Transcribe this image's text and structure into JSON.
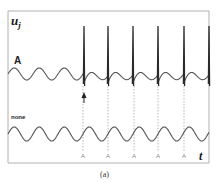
{
  "figure": {
    "y_axis_label": "u",
    "y_axis_subscript": "j",
    "x_axis_label": "t",
    "caption": "(a)",
    "traces": [
      {
        "name": "A",
        "label": "A",
        "type": "sinusoid-with-spikes",
        "center_y": 74,
        "amplitude": 6,
        "period": 25
      },
      {
        "name": "none",
        "label": "none",
        "type": "sinusoid",
        "center_y": 134,
        "amplitude": 7,
        "period": 25
      }
    ],
    "spike_times_px": [
      84,
      108,
      133,
      158,
      184,
      209
    ],
    "stimulus_marks": {
      "label": "A",
      "positions_px": [
        83,
        108,
        134,
        158,
        184
      ]
    },
    "stimulus_arrow_x": 84,
    "colors": {
      "frame": "#b0b0b0",
      "trace": "#555555",
      "spike": "#2a2a2a",
      "dashed": "#9a9a9a",
      "text": "#1a1a1a"
    }
  }
}
